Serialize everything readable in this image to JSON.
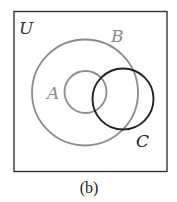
{
  "diagram": {
    "type": "venn",
    "caption": "(b)",
    "universe": {
      "label": "U",
      "border_color": "#333333"
    },
    "sets": [
      {
        "id": "B",
        "label": "B",
        "color": "#8a8a8a",
        "contains": [
          "A"
        ]
      },
      {
        "id": "A",
        "label": "A",
        "color": "#8a8a8a",
        "subset_of": "B"
      },
      {
        "id": "C",
        "label": "C",
        "color": "#222222",
        "overlaps": [
          "A",
          "B"
        ]
      }
    ]
  }
}
